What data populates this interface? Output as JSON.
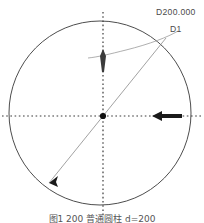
{
  "drawing": {
    "title_label": "D200.000",
    "dimension_id_label": "D1",
    "caption": "图1  200   普通圆柱 d=200",
    "colors": {
      "circle_stroke": "#4d4d4d",
      "centerline": "#3a3a3a",
      "dimension_line": "#8a8a8a",
      "leader_line": "#9a9a9a",
      "arrow_fill": "#1a1a1a",
      "center_dot": "#111111",
      "label_text": "#4a4a4a",
      "background": "#ffffff"
    },
    "geometry": {
      "center_x": 100,
      "center_y": 113,
      "radius": 91,
      "diameter_value": "200.000"
    },
    "elements": {
      "circle_name": "outer-circle",
      "horizontal_centerline_name": "horizontal-centerline",
      "vertical_centerline_name": "vertical-centerline",
      "diameter_line_name": "diameter-dimension-line",
      "leader_name": "leader-line",
      "center_point_name": "center-point"
    }
  }
}
